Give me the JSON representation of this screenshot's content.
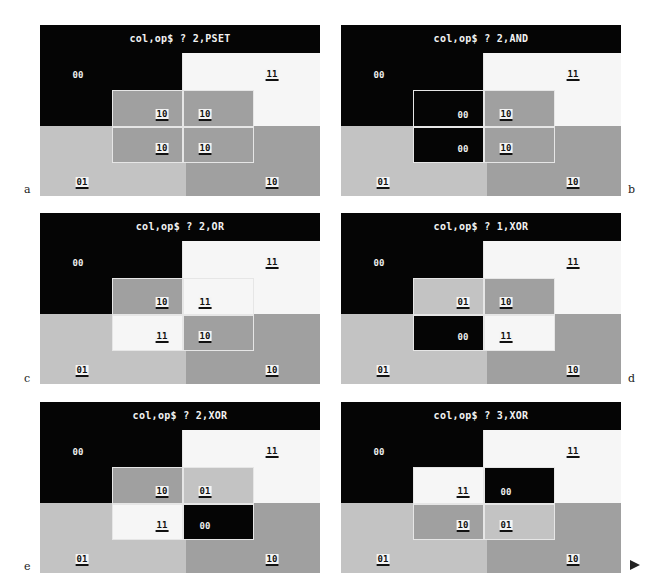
{
  "colors": {
    "c00": "#050505",
    "c01": "#c3c3c3",
    "c10": "#a0a0a0",
    "c11": "#f6f6f6",
    "title_bg": "#050505",
    "title_fg": "#f2f2f2",
    "outline": "#e6e6e6"
  },
  "panels": [
    {
      "letter": "a",
      "prompt": "col,op$ ? 2,PSET",
      "quadrants": {
        "tl": "00",
        "tr": "11",
        "bl": "01",
        "br": "10"
      },
      "overlay": {
        "tl": "10",
        "tr": "10",
        "bl": "10",
        "br": "10"
      }
    },
    {
      "letter": "b",
      "prompt": "col,op$ ? 2,AND",
      "quadrants": {
        "tl": "00",
        "tr": "11",
        "bl": "01",
        "br": "10"
      },
      "overlay": {
        "tl": "00",
        "tr": "10",
        "bl": "00",
        "br": "10"
      }
    },
    {
      "letter": "c",
      "prompt": "col,op$ ? 2,OR",
      "quadrants": {
        "tl": "00",
        "tr": "11",
        "bl": "01",
        "br": "10"
      },
      "overlay": {
        "tl": "10",
        "tr": "11",
        "bl": "11",
        "br": "10"
      }
    },
    {
      "letter": "d",
      "prompt": "col,op$ ? 1,XOR",
      "quadrants": {
        "tl": "00",
        "tr": "11",
        "bl": "01",
        "br": "10"
      },
      "overlay": {
        "tl": "01",
        "tr": "10",
        "bl": "00",
        "br": "11"
      }
    },
    {
      "letter": "e",
      "prompt": "col,op$ ? 2,XOR",
      "quadrants": {
        "tl": "00",
        "tr": "11",
        "bl": "01",
        "br": "10"
      },
      "overlay": {
        "tl": "10",
        "tr": "01",
        "bl": "11",
        "br": "00"
      }
    },
    {
      "letter": "f",
      "prompt": "col,op$ ? 3,XOR",
      "quadrants": {
        "tl": "00",
        "tr": "11",
        "bl": "01",
        "br": "10"
      },
      "overlay": {
        "tl": "11",
        "tr": "00",
        "bl": "10",
        "br": "01"
      }
    }
  ]
}
